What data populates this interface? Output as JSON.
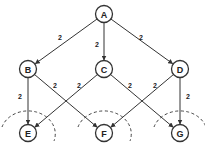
{
  "diagram": {
    "nodes": [
      {
        "id": "A",
        "label": "A",
        "x": 104,
        "y": 14
      },
      {
        "id": "B",
        "label": "B",
        "x": 28,
        "y": 69
      },
      {
        "id": "C",
        "label": "C",
        "x": 104,
        "y": 69
      },
      {
        "id": "D",
        "label": "D",
        "x": 180,
        "y": 69
      },
      {
        "id": "E",
        "label": "E",
        "x": 28,
        "y": 133
      },
      {
        "id": "F",
        "label": "F",
        "x": 104,
        "y": 133
      },
      {
        "id": "G",
        "label": "G",
        "x": 180,
        "y": 133
      }
    ],
    "edges": [
      {
        "from": "A",
        "to": "B",
        "weight": "2",
        "lx": 60,
        "ly": 37
      },
      {
        "from": "A",
        "to": "C",
        "weight": "2",
        "lx": 97,
        "ly": 44
      },
      {
        "from": "A",
        "to": "D",
        "weight": "2",
        "lx": 141,
        "ly": 37
      },
      {
        "from": "B",
        "to": "E",
        "weight": "2",
        "lx": 20,
        "ly": 96
      },
      {
        "from": "B",
        "to": "F",
        "weight": "2",
        "lx": 55,
        "ly": 85
      },
      {
        "from": "C",
        "to": "E",
        "weight": "2",
        "lx": 79,
        "ly": 85
      },
      {
        "from": "C",
        "to": "G",
        "weight": "2",
        "lx": 130,
        "ly": 85
      },
      {
        "from": "D",
        "to": "F",
        "weight": "2",
        "lx": 155,
        "ly": 85
      },
      {
        "from": "D",
        "to": "G",
        "weight": "2",
        "lx": 188,
        "ly": 96
      }
    ],
    "cuts": [
      {
        "around": "E",
        "cx": 28,
        "cy": 133
      },
      {
        "around": "F",
        "cx": 104,
        "cy": 133
      },
      {
        "around": "G",
        "cx": 180,
        "cy": 133
      }
    ]
  }
}
